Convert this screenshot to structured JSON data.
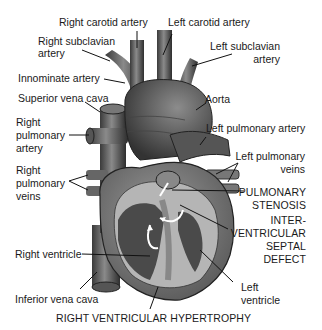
{
  "diagram": {
    "title": "RIGHT VENTRICULAR HYPERTROPHY",
    "labels": {
      "right_carotid_artery": "Right carotid artery",
      "left_carotid_artery": "Left carotid artery",
      "right_subclavian_artery_1": "Right subclavian",
      "right_subclavian_artery_2": "artery",
      "left_subclavian_artery_1": "Left subclavian",
      "left_subclavian_artery_2": "artery",
      "innominate_artery": "Innominate artery",
      "superior_vena_cava": "Superior vena cava",
      "aorta": "Aorta",
      "right_pulmonary_artery_1": "Right",
      "right_pulmonary_artery_2": "pulmonary",
      "right_pulmonary_artery_3": "artery",
      "left_pulmonary_artery": "Left pulmonary artery",
      "left_pulmonary_veins_1": "Left pulmonary",
      "left_pulmonary_veins_2": "veins",
      "right_pulmonary_veins_1": "Right",
      "right_pulmonary_veins_2": "pulmonary",
      "right_pulmonary_veins_3": "veins",
      "pulmonary_stenosis_1": "PULMONARY",
      "pulmonary_stenosis_2": "STENOSIS",
      "vsd_1": "INTER-",
      "vsd_2": "VENTRICULAR",
      "vsd_3": "SEPTAL",
      "vsd_4": "DEFECT",
      "right_ventricle": "Right ventricle",
      "inferior_vena_cava": "Inferior vena cava",
      "left_ventricle_1": "Left",
      "left_ventricle_2": "ventricle"
    }
  }
}
